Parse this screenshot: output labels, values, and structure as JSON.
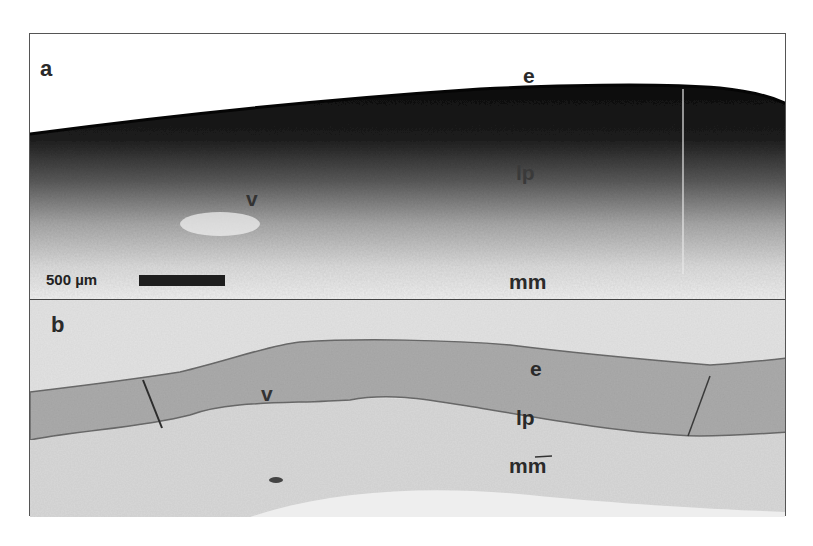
{
  "figure": {
    "panels": [
      {
        "id": "a",
        "letter": "a",
        "modality": "OCT grayscale image",
        "labels": {
          "epithelium": "e",
          "lamina_propria": "lp",
          "vessel": "v",
          "muscularis_mucosae": "mm"
        },
        "scale_bar": {
          "text": "500 µm"
        }
      },
      {
        "id": "b",
        "letter": "b",
        "modality": "histology section",
        "labels": {
          "epithelium": "e",
          "lamina_propria": "lp",
          "vessel": "v",
          "muscularis_mucosae": "mm"
        }
      }
    ],
    "colors": {
      "frame": "#555555",
      "dark_tissue": "#141414",
      "histology_epithelium": "#a9a9a9",
      "histology_background": "#e6e6e6"
    }
  }
}
